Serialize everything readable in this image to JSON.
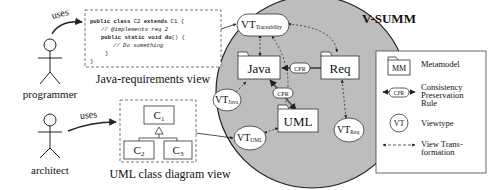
{
  "title": "V-SUMM",
  "actors": [
    {
      "label": "programmer",
      "uses_label": "uses"
    },
    {
      "label": "architect",
      "uses_label": "uses"
    }
  ],
  "java_view": {
    "caption": "Java-requirements view",
    "code_lines": [
      {
        "kw1": "public class",
        "t1": " C2 ",
        "kw2": "extends",
        "t2": " C1 {"
      },
      {
        "comment": "// @implements req 2"
      },
      {
        "kw1": "public static void do",
        "t1": "() {"
      },
      {
        "comment": "// Do something"
      },
      {
        "t1": "}"
      },
      {
        "t1": "}"
      }
    ]
  },
  "uml_view": {
    "caption": "UML class diagram view",
    "classes": [
      {
        "name": "C",
        "sub": "1"
      },
      {
        "name": "C",
        "sub": "2"
      },
      {
        "name": "C",
        "sub": "3"
      }
    ]
  },
  "vsumm": {
    "metamodels": [
      {
        "label": "Java"
      },
      {
        "label": "Req"
      },
      {
        "label": "UML"
      }
    ],
    "cprs": [
      {
        "label": "CPR"
      },
      {
        "label": "CPR"
      }
    ],
    "viewtypes": [
      {
        "base": "VT",
        "sub": "Traceability"
      },
      {
        "base": "VT",
        "sub": "Java"
      },
      {
        "base": "VT",
        "sub": "UML"
      },
      {
        "base": "VT",
        "sub": "Req"
      }
    ]
  },
  "legend": {
    "items": [
      {
        "symbol": "MM",
        "label_lines": [
          "Metamodel"
        ]
      },
      {
        "symbol": "CPR",
        "label_lines": [
          "Consistency",
          "Preservation",
          "Rule"
        ]
      },
      {
        "symbol": "VT",
        "label_lines": [
          "Viewtype"
        ]
      },
      {
        "symbol": "",
        "label_lines": [
          "View Trans-",
          "formation"
        ]
      }
    ]
  },
  "colors": {
    "vsumm_fill": "#bdbdbd",
    "stroke": "#333333",
    "box_fill": "#ffffff"
  }
}
